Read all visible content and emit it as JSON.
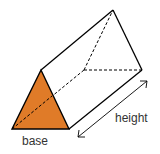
{
  "diagram": {
    "labels": {
      "base": "base",
      "height": "height"
    },
    "colors": {
      "base_fill": "#E07B28",
      "stroke": "#000000"
    },
    "shape": {
      "front_face": [
        [
          41,
          70
        ],
        [
          12,
          129
        ],
        [
          69,
          129
        ]
      ],
      "back_face": [
        [
          113,
          10
        ],
        [
          84,
          70
        ],
        [
          142,
          70
        ]
      ],
      "height_arrow": [
        [
          148,
          80
        ],
        [
          77,
          137
        ]
      ]
    }
  }
}
